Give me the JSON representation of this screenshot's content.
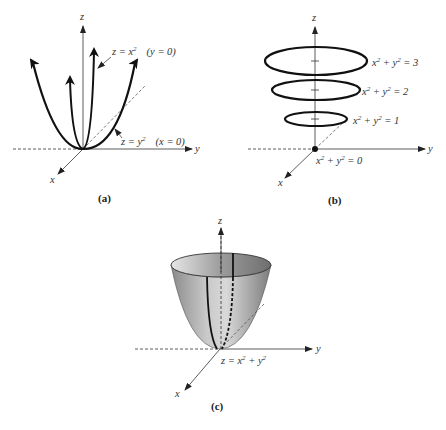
{
  "panels": [
    {
      "id": "a",
      "caption": "(a)",
      "axes": {
        "x": "x",
        "y": "y",
        "z": "z"
      },
      "labels": [
        {
          "text_main": "z = x",
          "sup": "2",
          "condition": "(y = 0)"
        },
        {
          "text_main": "z = y",
          "sup": "2",
          "condition": "(x = 0)"
        }
      ],
      "description": "Traces of z = x^2 + y^2 in the coordinate planes: parabolas opening upward"
    },
    {
      "id": "b",
      "caption": "(b)",
      "axes": {
        "x": "x",
        "y": "y",
        "z": "z"
      },
      "level_curves": [
        {
          "label_pre": "x",
          "sup1": "2",
          "label_mid": " + y",
          "sup2": "2",
          "label_post": " = 3",
          "value": 3
        },
        {
          "label_pre": "x",
          "sup1": "2",
          "label_mid": " + y",
          "sup2": "2",
          "label_post": " = 2",
          "value": 2
        },
        {
          "label_pre": "x",
          "sup1": "2",
          "label_mid": " + y",
          "sup2": "2",
          "label_post": " = 1",
          "value": 1
        },
        {
          "label_pre": "x",
          "sup1": "2",
          "label_mid": " + y",
          "sup2": "2",
          "label_post": " = 0",
          "value": 0
        }
      ],
      "description": "Horizontal cross sections are circles x^2 + y^2 = k"
    },
    {
      "id": "c",
      "caption": "(c)",
      "axes": {
        "x": "x",
        "y": "y",
        "z": "z"
      },
      "surface_label": {
        "text_main": "z = x",
        "sup1": "2",
        "mid": " + y",
        "sup2": "2"
      },
      "description": "Circular paraboloid z = x^2 + y^2",
      "colors": {
        "surface_light": "#d8d8d8",
        "surface_dark": "#8a8a8a",
        "rim": "#555555"
      }
    }
  ]
}
